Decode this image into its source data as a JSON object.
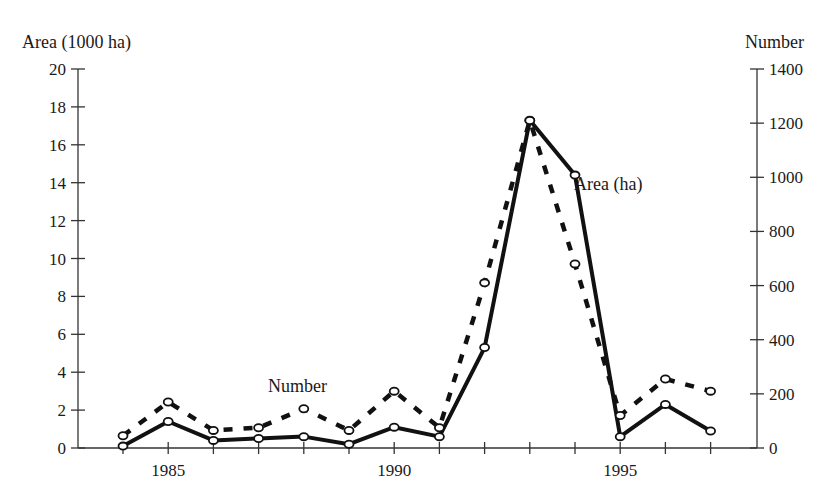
{
  "chart_data": {
    "type": "line",
    "title": "",
    "xlabel": "",
    "left_ylabel": "Area (1000 ha)",
    "right_ylabel": "Number",
    "x": [
      1984,
      1985,
      1986,
      1987,
      1988,
      1989,
      1990,
      1991,
      1992,
      1993,
      1994,
      1995,
      1996,
      1997
    ],
    "x_tick_labels": [
      "1985",
      "1990",
      "1995"
    ],
    "x_tick_values": [
      1985,
      1990,
      1995
    ],
    "left_ylim": [
      0,
      20
    ],
    "left_yticks": [
      0,
      2,
      4,
      6,
      8,
      10,
      12,
      14,
      16,
      18,
      20
    ],
    "right_ylim": [
      0,
      1400
    ],
    "right_yticks": [
      0,
      200,
      400,
      600,
      800,
      1000,
      1200,
      1400
    ],
    "grid": false,
    "series": [
      {
        "name": "Area (ha)",
        "axis": "left",
        "style": "solid",
        "values": [
          0.1,
          1.4,
          0.4,
          0.5,
          0.6,
          0.2,
          1.1,
          0.6,
          5.3,
          17.3,
          14.4,
          0.6,
          2.3,
          0.9
        ]
      },
      {
        "name": "Number",
        "axis": "right",
        "style": "dashed",
        "values": [
          45,
          170,
          65,
          75,
          145,
          65,
          210,
          75,
          610,
          1210,
          680,
          120,
          255,
          210
        ]
      }
    ],
    "annotations": [
      {
        "text": "Area (ha)",
        "near_x": 1994
      },
      {
        "text": "Number",
        "near_x": 1988
      }
    ],
    "legend": "inline labels"
  }
}
